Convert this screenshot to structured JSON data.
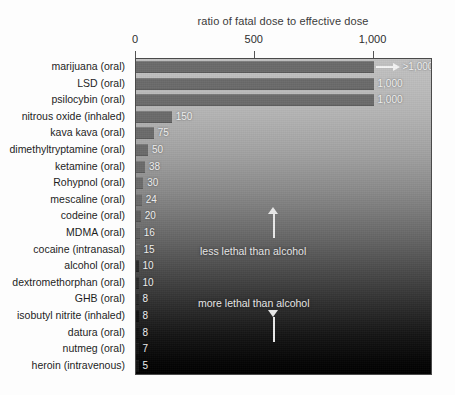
{
  "chart_data": {
    "type": "bar",
    "orientation": "horizontal",
    "title": "ratio of fatal dose to effective dose",
    "xlabel": "",
    "ylabel": "",
    "xlim": [
      0,
      1250
    ],
    "grid": false,
    "legend": null,
    "tick_labels": [
      "0",
      "500",
      "1,000"
    ],
    "tick_values": [
      0,
      500,
      1000
    ],
    "categories": [
      "marijuana (oral)",
      "LSD (oral)",
      "psilocybin (oral)",
      "nitrous oxide (inhaled)",
      "kava kava (oral)",
      "dimethyltryptamine (oral)",
      "ketamine (oral)",
      "Rohypnol (oral)",
      "mescaline (oral)",
      "codeine (oral)",
      "MDMA (oral)",
      "cocaine (intranasal)",
      "alcohol (oral)",
      "dextromethorphan (oral)",
      "GHB (oral)",
      "isobutyl nitrite (inhaled)",
      "datura (oral)",
      "nutmeg (oral)",
      "heroin (intravenous)"
    ],
    "values": [
      1000,
      1000,
      1000,
      150,
      75,
      50,
      38,
      30,
      24,
      20,
      16,
      15,
      10,
      10,
      8,
      8,
      8,
      7,
      5
    ],
    "value_labels": [
      ">1,000",
      "1,000",
      "1,000",
      "150",
      "75",
      "50",
      "38",
      "30",
      "24",
      "20",
      "16",
      "15",
      "10",
      "10",
      "8",
      "8",
      "8",
      "7",
      "5"
    ],
    "annotations": [
      {
        "text": "less lethal than alcohol",
        "arrow": "up"
      },
      {
        "text": "more lethal than alcohol",
        "arrow": "down"
      }
    ]
  },
  "colors": {
    "bar": "#6b6b6b",
    "text_light": "#f2f2f2",
    "text_dark": "#1e1e1e",
    "page_background": "#fdfdfd"
  }
}
